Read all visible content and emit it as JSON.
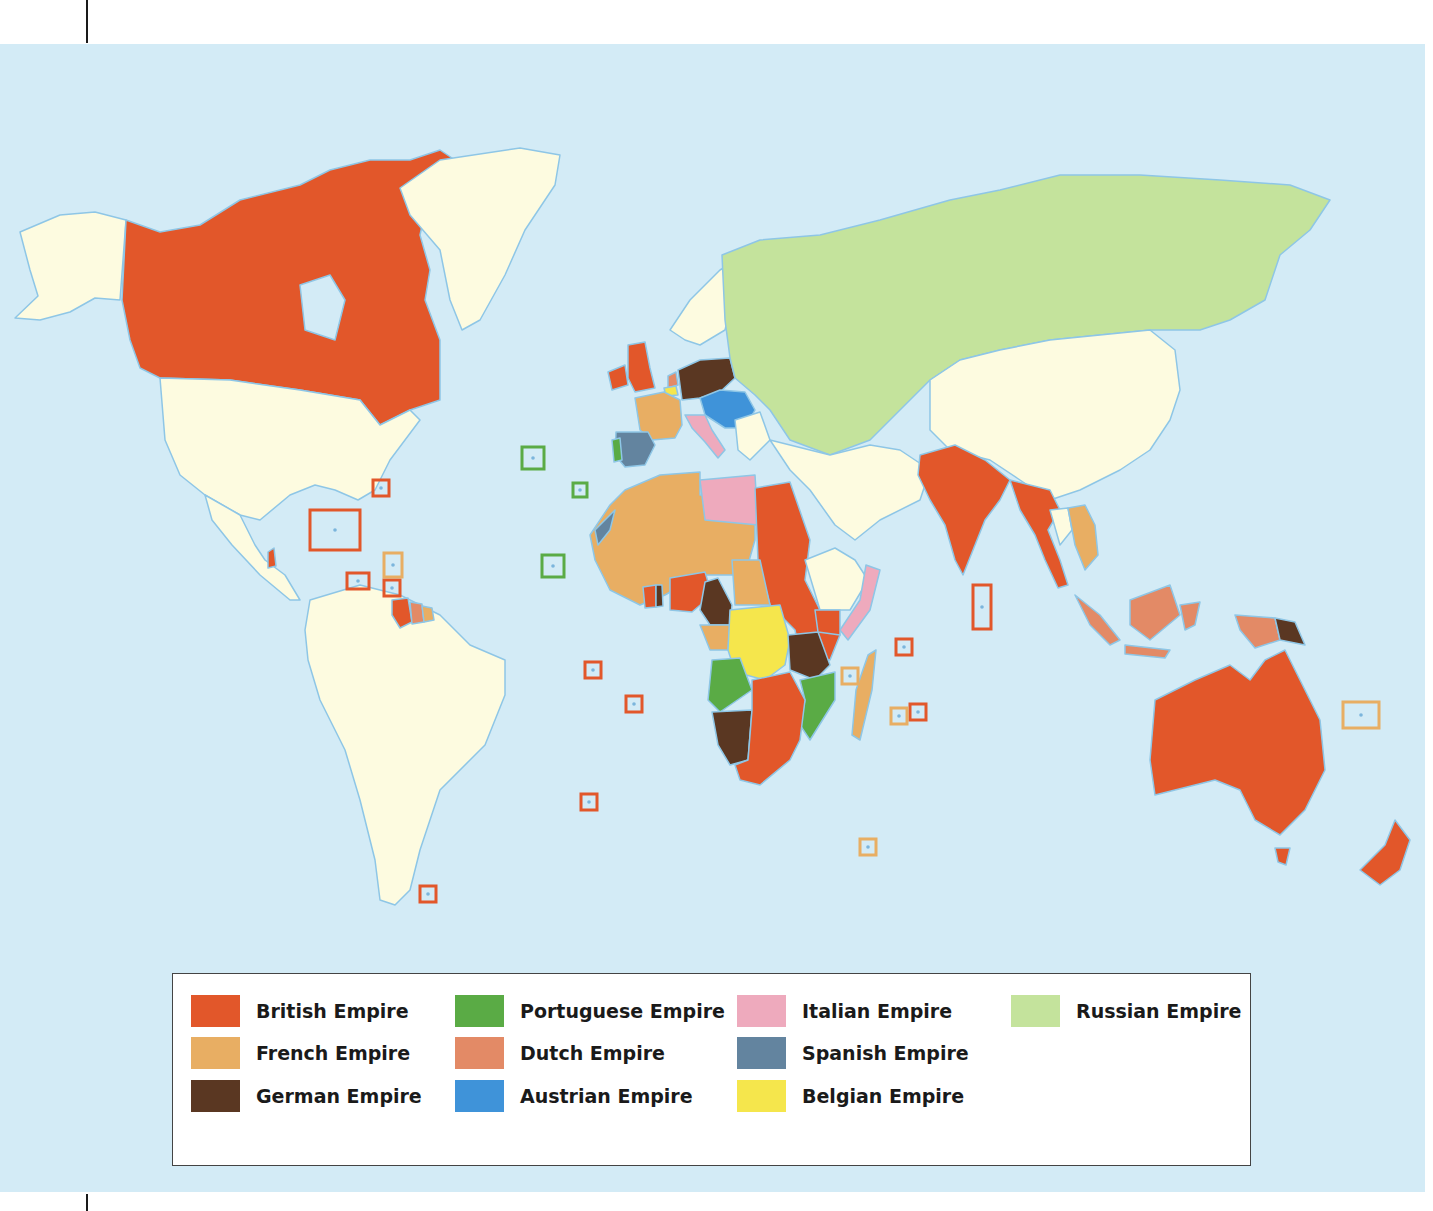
{
  "map": {
    "title": "",
    "background_color": "#d3ebf6",
    "unclaimed_land_color": "#fdfbe0",
    "coast_color": "#8ec6e6",
    "legend": {
      "items": [
        {
          "label": "British Empire",
          "color": "#e2572a",
          "key": "british"
        },
        {
          "label": "French Empire",
          "color": "#e8ae63",
          "key": "french"
        },
        {
          "label": "German Empire",
          "color": "#5a3722",
          "key": "german"
        },
        {
          "label": "Portuguese Empire",
          "color": "#5aab45",
          "key": "portuguese"
        },
        {
          "label": "Dutch Empire",
          "color": "#e38a66",
          "key": "dutch"
        },
        {
          "label": "Austrian Empire",
          "color": "#3f93d9",
          "key": "austrian"
        },
        {
          "label": "Italian Empire",
          "color": "#eeaabd",
          "key": "italian"
        },
        {
          "label": "Spanish Empire",
          "color": "#63849f",
          "key": "spanish"
        },
        {
          "label": "Belgian Empire",
          "color": "#f5e64c",
          "key": "belgian"
        },
        {
          "label": "Russian Empire",
          "color": "#c4e39c",
          "key": "russian"
        }
      ]
    },
    "regions": [
      {
        "name": "Alaska",
        "empire": "none"
      },
      {
        "name": "Canada",
        "empire": "british"
      },
      {
        "name": "Greenland",
        "empire": "none"
      },
      {
        "name": "United States",
        "empire": "none"
      },
      {
        "name": "Central America",
        "empire": "none"
      },
      {
        "name": "British Honduras",
        "empire": "british"
      },
      {
        "name": "South America",
        "empire": "none"
      },
      {
        "name": "British Guiana",
        "empire": "british"
      },
      {
        "name": "Dutch Guiana",
        "empire": "dutch"
      },
      {
        "name": "French Guiana",
        "empire": "french"
      },
      {
        "name": "Scandinavia",
        "empire": "none"
      },
      {
        "name": "Britain and Ireland",
        "empire": "british"
      },
      {
        "name": "Netherlands",
        "empire": "dutch"
      },
      {
        "name": "Belgium",
        "empire": "belgian"
      },
      {
        "name": "France",
        "empire": "french"
      },
      {
        "name": "Germany",
        "empire": "german"
      },
      {
        "name": "Austria-Hungary",
        "empire": "austrian"
      },
      {
        "name": "Italy",
        "empire": "italian"
      },
      {
        "name": "Spain",
        "empire": "spanish"
      },
      {
        "name": "Portugal",
        "empire": "portuguese"
      },
      {
        "name": "Balkans",
        "empire": "none"
      },
      {
        "name": "Russia",
        "empire": "russian"
      },
      {
        "name": "Middle East",
        "empire": "none"
      },
      {
        "name": "China",
        "empire": "none"
      },
      {
        "name": "India",
        "empire": "british"
      },
      {
        "name": "Burma and Malaya",
        "empire": "british"
      },
      {
        "name": "Indochina",
        "empire": "french"
      },
      {
        "name": "Siam",
        "empire": "none"
      },
      {
        "name": "Dutch East Indies",
        "empire": "dutch"
      },
      {
        "name": "German New Guinea",
        "empire": "german"
      },
      {
        "name": "Australia",
        "empire": "british"
      },
      {
        "name": "New Zealand",
        "empire": "british"
      },
      {
        "name": "French West Africa",
        "empire": "french"
      },
      {
        "name": "Spanish Sahara",
        "empire": "spanish"
      },
      {
        "name": "Libya",
        "empire": "italian"
      },
      {
        "name": "Anglo-Egyptian Sudan",
        "empire": "british"
      },
      {
        "name": "Ethiopia",
        "empire": "none"
      },
      {
        "name": "Italian Somaliland",
        "empire": "italian"
      },
      {
        "name": "Nigeria",
        "empire": "british"
      },
      {
        "name": "Gold Coast",
        "empire": "british"
      },
      {
        "name": "Togo",
        "empire": "german"
      },
      {
        "name": "Kamerun",
        "empire": "german"
      },
      {
        "name": "French Equatorial Africa",
        "empire": "french"
      },
      {
        "name": "Belgian Congo",
        "empire": "belgian"
      },
      {
        "name": "Angola",
        "empire": "portuguese"
      },
      {
        "name": "German South West Africa",
        "empire": "german"
      },
      {
        "name": "German East Africa",
        "empire": "german"
      },
      {
        "name": "British East Africa",
        "empire": "british"
      },
      {
        "name": "Mozambique",
        "empire": "portuguese"
      },
      {
        "name": "Southern Africa",
        "empire": "british"
      },
      {
        "name": "Madagascar",
        "empire": "french"
      }
    ],
    "island_callouts": [
      {
        "empire": "british",
        "count": 11
      },
      {
        "empire": "french",
        "count": 5
      },
      {
        "empire": "portuguese",
        "count": 3
      }
    ]
  }
}
